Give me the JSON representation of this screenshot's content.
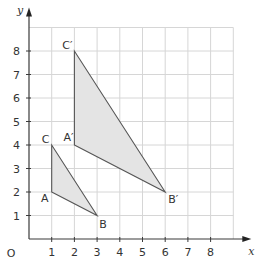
{
  "chart_data": {
    "type": "scatter",
    "title": "",
    "xlabel": "x",
    "ylabel": "y",
    "origin_label": "O",
    "xlim": [
      0,
      9
    ],
    "ylim": [
      0,
      9
    ],
    "grid": true,
    "x_ticks": [
      1,
      2,
      3,
      4,
      5,
      6,
      7,
      8
    ],
    "y_ticks": [
      1,
      2,
      3,
      4,
      5,
      6,
      7,
      8
    ],
    "x_tick_labels": [
      "1",
      "2",
      "3",
      "4",
      "5",
      "6",
      "7",
      "8"
    ],
    "y_tick_labels": [
      "1",
      "2",
      "3",
      "4",
      "5",
      "6",
      "7",
      "8"
    ],
    "shapes": [
      {
        "name": "ABC",
        "fill": "#e4e4e4",
        "vertices": [
          {
            "label": "A",
            "x": 1,
            "y": 2
          },
          {
            "label": "B",
            "x": 3,
            "y": 1
          },
          {
            "label": "C",
            "x": 1,
            "y": 4
          }
        ]
      },
      {
        "name": "A'B'C'",
        "fill": "#e4e4e4",
        "vertices": [
          {
            "label": "A′",
            "x": 2,
            "y": 4
          },
          {
            "label": "B′",
            "x": 6,
            "y": 2
          },
          {
            "label": "C′",
            "x": 2,
            "y": 8
          }
        ]
      }
    ]
  }
}
